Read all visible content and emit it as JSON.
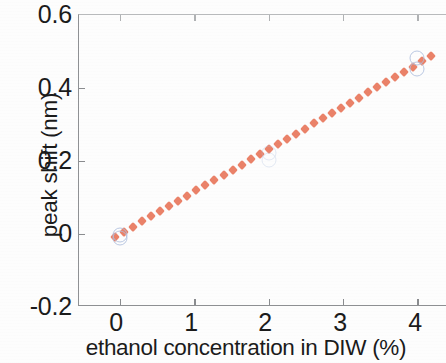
{
  "chart_data": {
    "type": "scatter",
    "title": "",
    "xlabel": "ethanol concentration in DIW (%)",
    "ylabel": "peak shift (nm)",
    "xlim": [
      -0.55,
      4.4
    ],
    "ylim": [
      -0.2,
      0.6
    ],
    "xticks": [
      0,
      1,
      2,
      3,
      4
    ],
    "xticklabels": [
      "0",
      "1",
      "2",
      "3",
      "4"
    ],
    "yticks": [
      -0.2,
      0,
      0.2,
      0.4,
      0.6
    ],
    "yticklabels": [
      "-0.2",
      "0",
      "0.2",
      "0.4",
      "0.6"
    ],
    "grid": false,
    "legend": false,
    "series": [
      {
        "name": "measured peak shift",
        "type": "scatter",
        "marker": "open-circle",
        "color": "#aebedd",
        "points": [
          {
            "x": 0,
            "y": -0.012
          },
          {
            "x": 0,
            "y": -0.004
          },
          {
            "x": 2,
            "y": 0.202
          },
          {
            "x": 2,
            "y": 0.222
          },
          {
            "x": 4,
            "y": 0.452
          },
          {
            "x": 4,
            "y": 0.482
          }
        ]
      },
      {
        "name": "linear fit",
        "type": "line",
        "linestyle": "dotted",
        "color": "#e8775c",
        "x_start": -0.06,
        "x_end": 4.18,
        "y_start": -0.008,
        "y_end": 0.487,
        "slope": 0.1165,
        "intercept": -0.001
      }
    ]
  },
  "axis": {
    "frame_color": "#8f9194",
    "tick_color": "#8a8c8f",
    "text_color": "#1b1b1b"
  }
}
